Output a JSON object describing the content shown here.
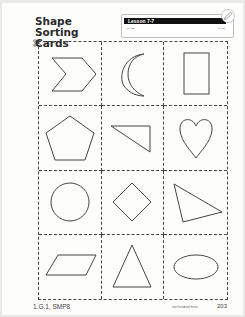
{
  "header": {
    "title_line1": "Shape Sorting",
    "title_line2": "Cards",
    "lesson_label": "Lesson 7-7",
    "name_label": "NAME",
    "date_label": "DATE"
  },
  "cards": [
    {
      "shape": "chevron"
    },
    {
      "shape": "crescent"
    },
    {
      "shape": "rectangle"
    },
    {
      "shape": "pentagon"
    },
    {
      "shape": "right-triangle"
    },
    {
      "shape": "heart"
    },
    {
      "shape": "circle"
    },
    {
      "shape": "rhombus"
    },
    {
      "shape": "scalene-triangle"
    },
    {
      "shape": "parallelogram"
    },
    {
      "shape": "isosceles-triangle"
    },
    {
      "shape": "oval"
    }
  ],
  "footer": {
    "standards": "1.G.1, SMP8",
    "page_words": "two hundred three",
    "page_number": "203"
  },
  "colors": {
    "line": "#444444",
    "lesson_bar": "#111111"
  }
}
